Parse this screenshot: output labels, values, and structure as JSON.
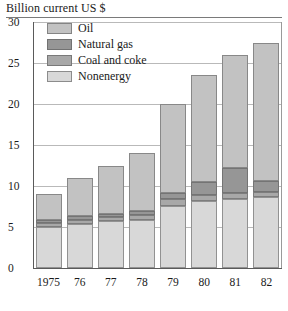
{
  "chart_data": {
    "type": "bar",
    "subtype": "stacked-bar",
    "title": "Billion current US $",
    "xlabel": "",
    "ylabel": "Billion current US $",
    "ylim": [
      0,
      30
    ],
    "yticks": [
      0,
      5,
      10,
      15,
      20,
      25,
      30
    ],
    "ytick_labels": [
      "0",
      "5",
      "10",
      "15",
      "20",
      "25",
      "30"
    ],
    "grid": true,
    "grid_axis": "y",
    "legend_position": "upper-left-inside",
    "categories": [
      "1975",
      "76",
      "77",
      "78",
      "79",
      "80",
      "81",
      "82"
    ],
    "stack_order_bottom_to_top": [
      "Nonenergy",
      "Coal and coke",
      "Natural gas",
      "Oil"
    ],
    "series": [
      {
        "name": "Nonenergy",
        "color": "#d8d8d8",
        "values": [
          5.0,
          5.4,
          5.7,
          5.9,
          7.6,
          8.2,
          8.4,
          8.6
        ]
      },
      {
        "name": "Coal and coke",
        "color": "#a8a8a8",
        "values": [
          0.5,
          0.5,
          0.5,
          0.6,
          0.8,
          0.7,
          0.7,
          0.7
        ]
      },
      {
        "name": "Natural gas",
        "color": "#969696",
        "values": [
          0.4,
          0.4,
          0.4,
          0.5,
          0.8,
          1.6,
          3.1,
          1.3
        ]
      },
      {
        "name": "Oil",
        "color": "#c2c2c2",
        "values": [
          3.1,
          4.7,
          5.9,
          7.0,
          10.8,
          13.0,
          13.8,
          16.9
        ]
      }
    ],
    "totals": [
      9.0,
      11.0,
      12.5,
      14.0,
      20.0,
      23.5,
      26.0,
      27.5
    ]
  },
  "legend": {
    "items": [
      {
        "label": "Oil",
        "color": "#c2c2c2"
      },
      {
        "label": "Natural gas",
        "color": "#969696"
      },
      {
        "label": "Coal and coke",
        "color": "#a8a8a8"
      },
      {
        "label": "Nonenergy",
        "color": "#d8d8d8"
      }
    ]
  }
}
